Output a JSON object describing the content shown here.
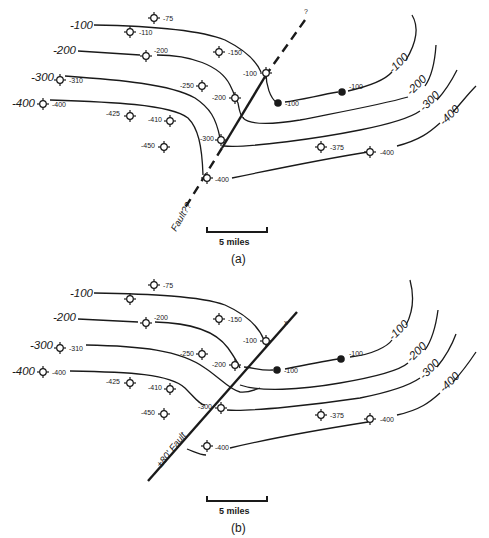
{
  "panels": {
    "a": {
      "caption": "(a)",
      "fault_label": "Fault??",
      "fault_query": "?",
      "scale_label": "5 miles",
      "contour_labels_left": [
        "-100",
        "-200",
        "-300",
        "-400"
      ],
      "contour_labels_right": [
        "-100",
        "-200",
        "-300",
        "-400"
      ],
      "wells": [
        {
          "label": "-75"
        },
        {
          "label": "-110"
        },
        {
          "label": "-200"
        },
        {
          "label": "-150"
        },
        {
          "label": "-310"
        },
        {
          "label": "-250"
        },
        {
          "label": "-100"
        },
        {
          "label": "-200"
        },
        {
          "label": "-400"
        },
        {
          "label": "-425"
        },
        {
          "label": "-410"
        },
        {
          "label": "-300"
        },
        {
          "label": "-450"
        },
        {
          "label": "-400"
        },
        {
          "label": "-375"
        },
        {
          "label": "-400"
        }
      ],
      "control_points": [
        {
          "label": "-100"
        },
        {
          "label": "-100"
        }
      ]
    },
    "b": {
      "caption": "(b)",
      "fault_label": "±80' Fault",
      "fault_mark": "x",
      "scale_label": "5 miles",
      "contour_labels_left": [
        "-100",
        "-200",
        "-300",
        "-400"
      ],
      "contour_labels_right": [
        "-100",
        "-200",
        "-300",
        "-400"
      ],
      "wells": [
        {
          "label": "-75"
        },
        {
          "label": ""
        },
        {
          "label": "-200"
        },
        {
          "label": "-150"
        },
        {
          "label": "-310"
        },
        {
          "label": "-250"
        },
        {
          "label": "-100"
        },
        {
          "label": "-200"
        },
        {
          "label": "-400"
        },
        {
          "label": "-425"
        },
        {
          "label": "-410"
        },
        {
          "label": "-300"
        },
        {
          "label": "-450"
        },
        {
          "label": "-400"
        },
        {
          "label": "-375"
        },
        {
          "label": "-400"
        }
      ],
      "control_points": [
        {
          "label": "-100"
        },
        {
          "label": "-100"
        }
      ]
    }
  }
}
